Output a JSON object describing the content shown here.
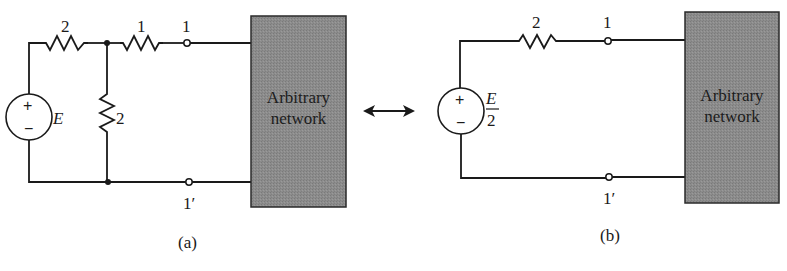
{
  "figure": {
    "panel_a": {
      "caption": "(a)",
      "source": {
        "plus": "+",
        "minus": "−",
        "label": "E"
      },
      "series_resistor_left": {
        "label": "2"
      },
      "series_resistor_right": {
        "label": "1"
      },
      "shunt_resistor": {
        "label": "2"
      },
      "terminal_top": {
        "label": "1"
      },
      "terminal_bottom": {
        "label": "1′"
      },
      "network_box": {
        "line1": "Arbitrary",
        "line2": "network",
        "color": "#8a8a8a"
      }
    },
    "equivalence_arrow": {
      "symbol": "double-headed-arrow"
    },
    "panel_b": {
      "caption": "(b)",
      "source": {
        "plus": "+",
        "minus": "−",
        "label_numerator": "E",
        "label_denominator": "2"
      },
      "series_resistor": {
        "label": "2"
      },
      "terminal_top": {
        "label": "1"
      },
      "terminal_bottom": {
        "label": "1′"
      },
      "network_box": {
        "line1": "Arbitrary",
        "line2": "network",
        "color": "#8a8a8a"
      }
    }
  }
}
